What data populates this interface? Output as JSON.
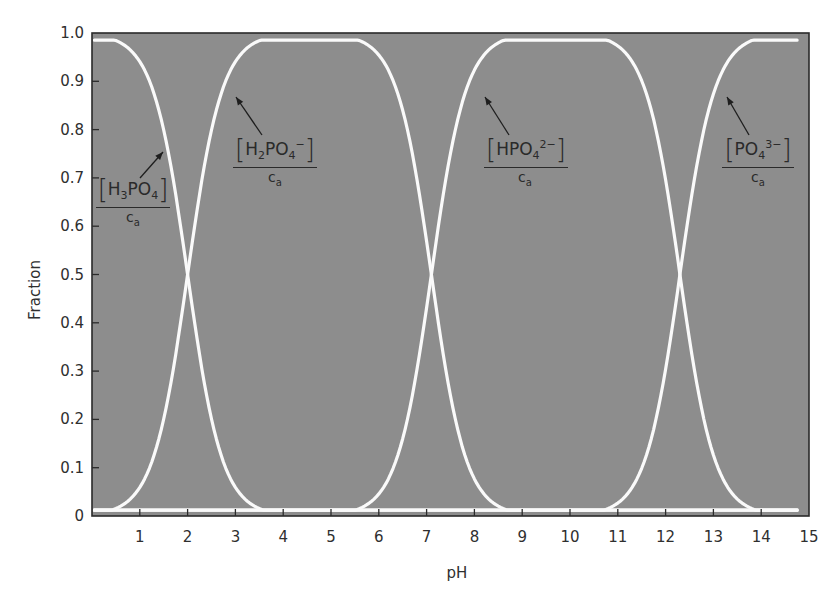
{
  "chart_data": {
    "type": "line",
    "title": "",
    "xlabel": "pH",
    "ylabel": "Fraction",
    "xlim": [
      0,
      15
    ],
    "ylim": [
      0,
      1.0
    ],
    "grid": false,
    "legend": "inline annotations with arrows",
    "x_ticks": [
      "1",
      "2",
      "3",
      "4",
      "5",
      "6",
      "7",
      "8",
      "9",
      "10",
      "11",
      "12",
      "13",
      "14",
      "15"
    ],
    "y_ticks": [
      "0",
      "0.1",
      "0.2",
      "0.3",
      "0.4",
      "0.5",
      "0.6",
      "0.7",
      "0.8",
      "0.9",
      "1.0"
    ],
    "pKa": [
      2.0,
      7.1,
      12.3
    ],
    "curve_x_range": [
      0.05,
      14.75
    ],
    "colors": {
      "background": "#8d8d8d",
      "curve": "#fafafa",
      "axis": "#2a2a2a"
    },
    "x": [
      0,
      1,
      2,
      3,
      4,
      5,
      6,
      7,
      8,
      9,
      10,
      11,
      12,
      13,
      14,
      14.75
    ],
    "series": [
      {
        "name": "[H3PO4]/ca",
        "values": [
          1.0,
          0.94,
          0.5,
          0.06,
          0.0,
          0.0,
          0.0,
          0.0,
          0.0,
          0.0,
          0.0,
          0.0,
          0.0,
          0.0,
          0.0,
          0.0
        ]
      },
      {
        "name": "[H2PO4-]/ca",
        "values": [
          0.0,
          0.06,
          0.5,
          0.94,
          1.0,
          1.0,
          0.99,
          0.64,
          0.08,
          0.01,
          0.0,
          0.0,
          0.0,
          0.0,
          0.0,
          0.0
        ]
      },
      {
        "name": "[HPO4 2-]/ca",
        "values": [
          0.0,
          0.0,
          0.0,
          0.0,
          0.0,
          0.01,
          0.05,
          0.36,
          0.92,
          0.99,
          1.0,
          1.0,
          0.7,
          0.12,
          0.01,
          0.0
        ]
      },
      {
        "name": "[PO4 3-]/ca",
        "values": [
          0.0,
          0.0,
          0.0,
          0.0,
          0.0,
          0.0,
          0.0,
          0.0,
          0.0,
          0.0,
          0.0,
          0.02,
          0.3,
          0.88,
          0.99,
          1.0
        ]
      }
    ],
    "annotations": [
      {
        "species": "H3PO4",
        "prefix": "H",
        "sub1": "3",
        "mid": "PO",
        "sub2": "4",
        "sup": "",
        "den": "c",
        "den_sub": "a"
      },
      {
        "species": "H2PO4-",
        "prefix": "H",
        "sub1": "2",
        "mid": "PO",
        "sub2": "4",
        "sup": "−",
        "den": "c",
        "den_sub": "a"
      },
      {
        "species": "HPO4 2-",
        "prefix": "HPO",
        "sub1": "",
        "mid": "",
        "sub2": "4",
        "sup": "2−",
        "den": "c",
        "den_sub": "a"
      },
      {
        "species": "PO4 3-",
        "prefix": "PO",
        "sub1": "",
        "mid": "",
        "sub2": "4",
        "sup": "3−",
        "den": "c",
        "den_sub": "a"
      }
    ]
  }
}
